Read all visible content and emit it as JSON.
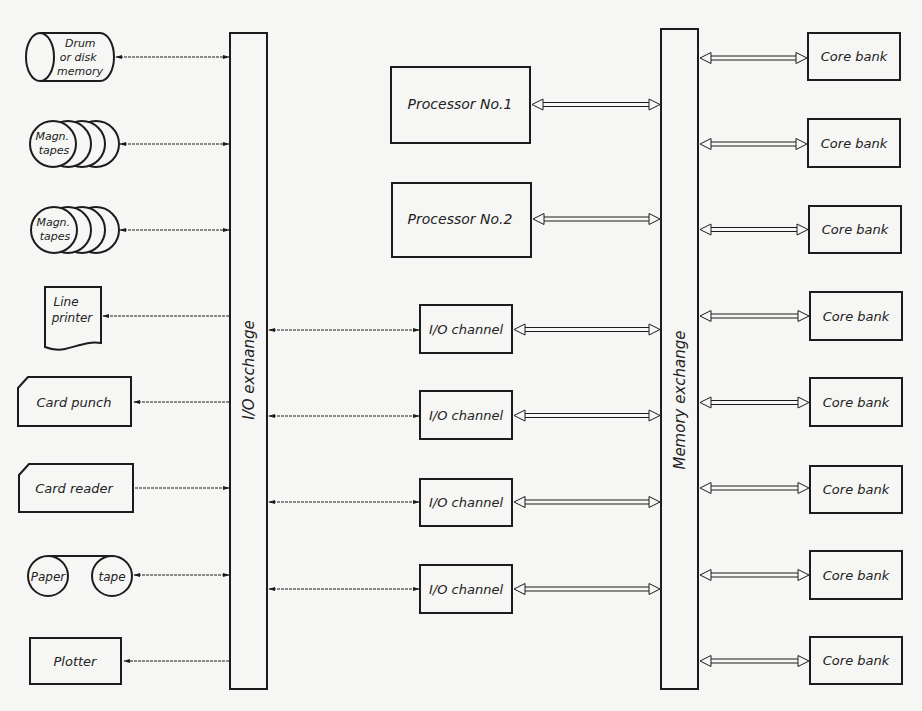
{
  "diagram": {
    "type": "block-diagram",
    "colors": {
      "background": "#f6f6f4",
      "ink": "#1c1c1c"
    },
    "buses": {
      "io_exchange": {
        "label": "I/O exchange"
      },
      "memory_exchange": {
        "label": "Memory exchange"
      }
    },
    "peripherals": [
      {
        "id": "drum",
        "label_lines": [
          "Drum",
          "or disk",
          "memory"
        ],
        "shape": "cylinder",
        "link": "bidirectional"
      },
      {
        "id": "tapes1",
        "label_lines": [
          "Magn.",
          "tapes"
        ],
        "shape": "tape-reels",
        "link": "bidirectional"
      },
      {
        "id": "tapes2",
        "label_lines": [
          "Magn.",
          "tapes"
        ],
        "shape": "tape-reels",
        "link": "bidirectional"
      },
      {
        "id": "printer",
        "label_lines": [
          "Line",
          "printer"
        ],
        "shape": "document",
        "link": "output"
      },
      {
        "id": "punch",
        "label_lines": [
          "Card punch"
        ],
        "shape": "card",
        "link": "output"
      },
      {
        "id": "reader",
        "label_lines": [
          "Card reader"
        ],
        "shape": "card",
        "link": "input"
      },
      {
        "id": "papertape",
        "label_lines": [
          "Paper",
          "tape"
        ],
        "shape": "paper-tape-reels",
        "link": "bidirectional"
      },
      {
        "id": "plotter",
        "label_lines": [
          "Plotter"
        ],
        "shape": "box",
        "link": "output"
      }
    ],
    "processors": [
      {
        "label": "Processor No.1"
      },
      {
        "label": "Processor No.2"
      }
    ],
    "io_channels": [
      {
        "label": "I/O channel"
      },
      {
        "label": "I/O channel"
      },
      {
        "label": "I/O channel"
      },
      {
        "label": "I/O channel"
      }
    ],
    "core_banks": [
      {
        "label": "Core bank"
      },
      {
        "label": "Core bank"
      },
      {
        "label": "Core bank"
      },
      {
        "label": "Core bank"
      },
      {
        "label": "Core bank"
      },
      {
        "label": "Core bank"
      },
      {
        "label": "Core bank"
      },
      {
        "label": "Core bank"
      }
    ]
  }
}
